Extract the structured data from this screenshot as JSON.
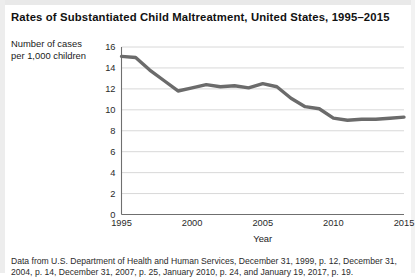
{
  "figure": {
    "title": "Rates of Substantiated Child Maltreatment, United States, 1995–2015",
    "y_axis_caption_line1": "Number of cases",
    "y_axis_caption_line2": "per 1,000 children",
    "source_note_line1": "Data from U.S. Department of Health and Human Services, December 31, 1999, p. 12, December 31,",
    "source_note_line2": "2004, p. 14, December 31, 2007, p. 25, January 2010, p. 24, and January 19, 2017, p. 19."
  },
  "colors": {
    "line": "#6b6b6b",
    "grid": "#d8d8d8",
    "axis": "#6f6f6f",
    "text": "#1a1a1a",
    "background": "#ffffff",
    "band": "#e9e9e9"
  },
  "chart_data": {
    "type": "line",
    "title": "Rates of Substantiated Child Maltreatment, United States, 1995–2015",
    "xlabel": "Year",
    "ylabel": "Number of cases per 1,000 children",
    "xlim": [
      1995,
      2015
    ],
    "ylim": [
      0,
      16
    ],
    "ytick_step": 2,
    "xtick_step": 5,
    "yticks": [
      0,
      2,
      4,
      6,
      8,
      10,
      12,
      14,
      16
    ],
    "xticks": [
      1995,
      2000,
      2005,
      2010,
      2015
    ],
    "grid": "horizontal",
    "legend": "none",
    "series": [
      {
        "name": "Substantiated child maltreatment rate",
        "x": [
          1995,
          1996,
          1997,
          1998,
          1999,
          2000,
          2001,
          2002,
          2003,
          2004,
          2005,
          2006,
          2007,
          2008,
          2009,
          2010,
          2011,
          2012,
          2013,
          2014,
          2015
        ],
        "values": [
          15.1,
          15.0,
          13.8,
          12.8,
          11.8,
          12.1,
          12.4,
          12.2,
          12.3,
          12.1,
          12.5,
          12.2,
          11.1,
          10.3,
          10.1,
          9.2,
          9.0,
          9.1,
          9.1,
          9.2,
          9.3
        ]
      }
    ]
  },
  "axis_labels": {
    "x_title": "Year",
    "x_ticks": [
      "1995",
      "2000",
      "2005",
      "2010",
      "2015"
    ],
    "y_ticks": [
      "0",
      "2",
      "4",
      "6",
      "8",
      "10",
      "12",
      "14",
      "16"
    ]
  }
}
